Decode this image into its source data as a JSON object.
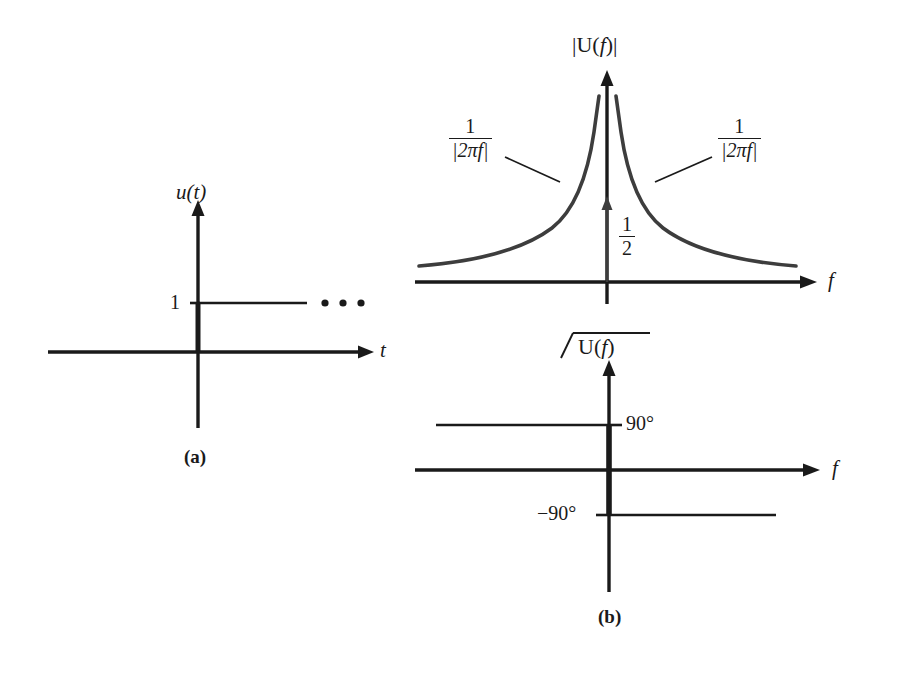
{
  "figure": {
    "width": 897,
    "height": 673,
    "background": "#ffffff",
    "ink": "#1a1a1a",
    "curve_color": "#3d3d3d"
  },
  "panel_a": {
    "caption": "(a)",
    "y_axis_label": "u(t)",
    "x_axis_label": "t",
    "amplitude_tick": "1",
    "ellipsis": "• • •",
    "description": "unit step function u(t) equal to 1 for t greater than 0"
  },
  "panel_b": {
    "caption": "(b)",
    "magnitude_plot": {
      "title": "|U(f)|",
      "x_axis_label": "f",
      "impulse_label_numerator": "1",
      "impulse_label_denominator": "2",
      "curve_label_left_numerator": "1",
      "curve_label_left_denominator": "|2πf|",
      "curve_label_right_numerator": "1",
      "curve_label_right_denominator": "|2πf|"
    },
    "phase_plot": {
      "title_angle_symbol": "∠",
      "title": "U(f)",
      "x_axis_label": "f",
      "positive_tick": "90°",
      "negative_tick": "−90°"
    }
  },
  "chart_data": {
    "type": "line",
    "panels": [
      {
        "id": "a",
        "label": "(a)",
        "type": "line",
        "title": "u(t)",
        "xlabel": "t",
        "ylabel": "u(t)",
        "series": [
          {
            "name": "u(t)",
            "x": [
              -1,
              0,
              0,
              1
            ],
            "y": [
              0,
              0,
              1,
              1
            ]
          }
        ],
        "annotations": [
          "1",
          "• • •"
        ],
        "grid": false,
        "legend": false
      },
      {
        "id": "b-magnitude",
        "label": "|U(f)|",
        "type": "line",
        "title": "|U(f)|",
        "xlabel": "f",
        "ylabel": "|U(f)|",
        "series": [
          {
            "name": "1/|2*pi*f|",
            "formula": "1/|2πf|",
            "x": [
              -1.0,
              -0.8,
              -0.6,
              -0.45,
              -0.33,
              -0.24,
              -0.17,
              -0.12,
              -0.08,
              -0.05,
              0.05,
              0.08,
              0.12,
              0.17,
              0.24,
              0.33,
              0.45,
              0.6,
              0.8,
              1.0
            ],
            "y": [
              0.159,
              0.199,
              0.265,
              0.354,
              0.482,
              0.663,
              0.936,
              1.326,
              1.989,
              3.183,
              3.183,
              1.989,
              1.326,
              0.936,
              0.663,
              0.482,
              0.354,
              0.265,
              0.199,
              0.159
            ]
          },
          {
            "name": "impulse at f=0",
            "formula": "(1/2)δ(f)",
            "x": [
              0
            ],
            "y": [
              0.5
            ],
            "style": "impulse-arrow"
          }
        ],
        "annotations": [
          "1/|2πf|",
          "1/|2πf|",
          "1/2"
        ],
        "grid": false,
        "legend": false
      },
      {
        "id": "b-phase",
        "label": "∠U(f)",
        "type": "line",
        "title": "∠U(f)",
        "xlabel": "f",
        "ylabel": "∠U(f)",
        "yunits": "degrees",
        "series": [
          {
            "name": "phase",
            "x": [
              -1.0,
              -0.001,
              0.001,
              1.0
            ],
            "y": [
              90,
              90,
              -90,
              -90
            ]
          }
        ],
        "ytick_labels": [
          "90°",
          "−90°"
        ],
        "ytick_values": [
          90,
          -90
        ],
        "grid": false,
        "legend": false
      }
    ]
  }
}
